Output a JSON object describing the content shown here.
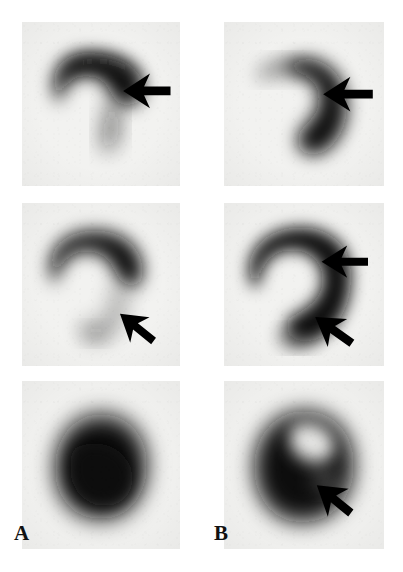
{
  "figure": {
    "kind": "nuclear-medicine-scintigraphy-figure",
    "background_color": "#ffffff",
    "panel_background_color": "#f2f2f0",
    "tracer_color": "#101010",
    "arrow_color": "#000000",
    "width_px": 403,
    "height_px": 572
  },
  "columns": [
    {
      "id": "A",
      "label": "A",
      "label_x": 14,
      "label_y": 523
    },
    {
      "id": "B",
      "label": "B",
      "label_x": 214,
      "label_y": 523
    }
  ],
  "panels": [
    {
      "name": "panel-a-row1",
      "column": "A",
      "row": 1,
      "x": 22,
      "y": 22,
      "w": 158,
      "h": 164,
      "uptake_shape": "comma-shaped horseshoe with thin inferior limb",
      "arrow_count": 1,
      "arrows": [
        {
          "name": "arrow-a1",
          "tip_x": 0.64,
          "tip_y": 0.42,
          "angle_deg": 0,
          "length": 0.3,
          "head": 0.17,
          "style": "solid-left-pointing"
        }
      ]
    },
    {
      "name": "panel-b-row1",
      "column": "B",
      "row": 1,
      "x": 224,
      "y": 22,
      "w": 160,
      "h": 164,
      "uptake_shape": "thick crescent, dense right limb",
      "arrow_count": 1,
      "arrows": [
        {
          "name": "arrow-b1",
          "tip_x": 0.62,
          "tip_y": 0.44,
          "angle_deg": 0,
          "length": 0.31,
          "head": 0.17,
          "style": "solid-left-pointing"
        }
      ]
    },
    {
      "name": "panel-a-row2",
      "column": "A",
      "row": 2,
      "x": 22,
      "y": 203,
      "w": 158,
      "h": 163,
      "uptake_shape": "question-mark horseshoe, faint lower limb",
      "arrow_count": 1,
      "arrows": [
        {
          "name": "arrow-a2",
          "tip_x": 0.62,
          "tip_y": 0.68,
          "angle_deg": 38,
          "length": 0.27,
          "head": 0.16,
          "style": "solid-oblique-upleft"
        }
      ]
    },
    {
      "name": "panel-b-row2",
      "column": "B",
      "row": 2,
      "x": 224,
      "y": 203,
      "w": 160,
      "h": 163,
      "uptake_shape": "thick dense question-mark horseshoe",
      "arrow_count": 2,
      "arrows": [
        {
          "name": "arrow-b2-upper",
          "tip_x": 0.61,
          "tip_y": 0.36,
          "angle_deg": 0,
          "length": 0.29,
          "head": 0.16,
          "style": "solid-left-pointing"
        },
        {
          "name": "arrow-b2-lower",
          "tip_x": 0.57,
          "tip_y": 0.7,
          "angle_deg": 35,
          "length": 0.28,
          "head": 0.17,
          "style": "solid-oblique-upleft"
        }
      ]
    },
    {
      "name": "panel-a-row3",
      "column": "A",
      "row": 3,
      "x": 22,
      "y": 381,
      "w": 158,
      "h": 168,
      "uptake_shape": "solid rounded mass, homogeneous uptake",
      "arrow_count": 0,
      "arrows": []
    },
    {
      "name": "panel-b-row3",
      "column": "B",
      "row": 3,
      "x": 224,
      "y": 381,
      "w": 160,
      "h": 168,
      "uptake_shape": "rounded mass with central photopenic defect",
      "arrow_count": 1,
      "arrows": [
        {
          "name": "arrow-b3",
          "tip_x": 0.58,
          "tip_y": 0.62,
          "angle_deg": 38,
          "length": 0.27,
          "head": 0.17,
          "style": "solid-oblique-upleft"
        }
      ]
    }
  ]
}
